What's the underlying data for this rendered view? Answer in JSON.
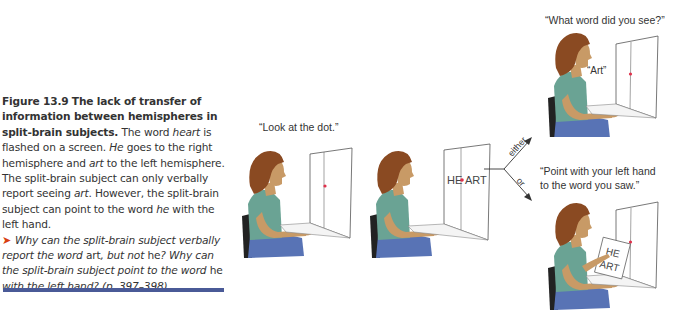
{
  "caption": {
    "figure_label": "Figure 13.9",
    "title": "The lack of transfer of information between hemispheres in split-brain subjects.",
    "body_parts": [
      {
        "text": " The word ",
        "style": "normal"
      },
      {
        "text": "heart",
        "style": "italic"
      },
      {
        "text": " is flashed on a screen. ",
        "style": "normal"
      },
      {
        "text": "He",
        "style": "italic"
      },
      {
        "text": " goes to the right hemisphere and ",
        "style": "normal"
      },
      {
        "text": "art",
        "style": "italic"
      },
      {
        "text": " to the left hemisphere. The split-brain subject can only verbally report seeing ",
        "style": "normal"
      },
      {
        "text": "art",
        "style": "italic"
      },
      {
        "text": ". However, the split-brain subject can point to the word ",
        "style": "normal"
      },
      {
        "text": "he",
        "style": "italic"
      },
      {
        "text": " with the left hand.",
        "style": "normal"
      }
    ],
    "question_icon": "arrow-right-icon",
    "question_parts": [
      {
        "text": "Why can the split-brain subject verbally report the word ",
        "style": "italic"
      },
      {
        "text": "art",
        "style": "normal"
      },
      {
        "text": ", but not ",
        "style": "italic"
      },
      {
        "text": "he",
        "style": "normal"
      },
      {
        "text": "? Why can the split-brain subject point to the word ",
        "style": "italic"
      },
      {
        "text": "he",
        "style": "normal"
      },
      {
        "text": " with the left hand? (p. 397–398)",
        "style": "italic"
      }
    ],
    "rule_color": "#4a5a97",
    "accent_color": "#d8400f"
  },
  "figure": {
    "panel1": {
      "quote": "“Look at the dot.”"
    },
    "panel2": {
      "screen_word_left": "HE",
      "screen_word_right": "ART"
    },
    "branch": {
      "upper_label": "either",
      "lower_label": "or"
    },
    "panel3": {
      "quote": "“What word did you see?”",
      "response": "“Art”"
    },
    "panel4": {
      "quote_line1": "“Point with your left hand",
      "quote_line2": "to the word you saw.”",
      "card_word_top": "HE",
      "card_word_bottom": "ART"
    },
    "colors": {
      "shirt": "#6aa394",
      "pants": "#5873b5",
      "hair": "#8a4a22",
      "skin": "#c89a66",
      "dot": "#e0304a",
      "chair": "#222222"
    }
  }
}
